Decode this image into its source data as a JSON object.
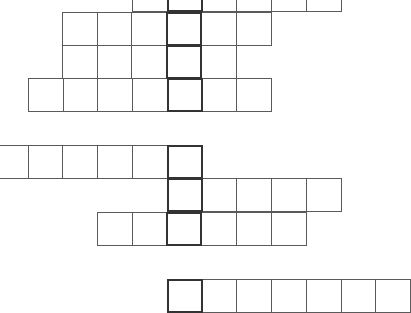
{
  "puzzle": {
    "type": "crossword-style grid blocks",
    "cell_size": 35,
    "line_color": "#5a5a5a",
    "highlight_color": "#333333",
    "groups": [
      {
        "name": "group-1",
        "rows": [
          {
            "y": -22,
            "x_start": 132,
            "cells": 6,
            "highlight_index": 1
          },
          {
            "y": 12,
            "x_start": 62,
            "cells": 6,
            "highlight_index": 3
          },
          {
            "y": 45,
            "x_start": 62,
            "cells": 5,
            "highlight_index": 3
          },
          {
            "y": 78,
            "x_start": 28,
            "cells": 7,
            "highlight_index": 4
          }
        ]
      },
      {
        "name": "group-2",
        "rows": [
          {
            "y": 145,
            "x_start": -7,
            "cells": 6,
            "highlight_index": 5
          },
          {
            "y": 178,
            "x_start": 167,
            "cells": 5,
            "highlight_index": 0
          },
          {
            "y": 212,
            "x_start": 97,
            "cells": 6,
            "highlight_index": 2
          }
        ]
      },
      {
        "name": "group-3",
        "rows": [
          {
            "y": 279,
            "x_start": 167,
            "cells": 7,
            "highlight_index": 0
          }
        ]
      }
    ]
  }
}
